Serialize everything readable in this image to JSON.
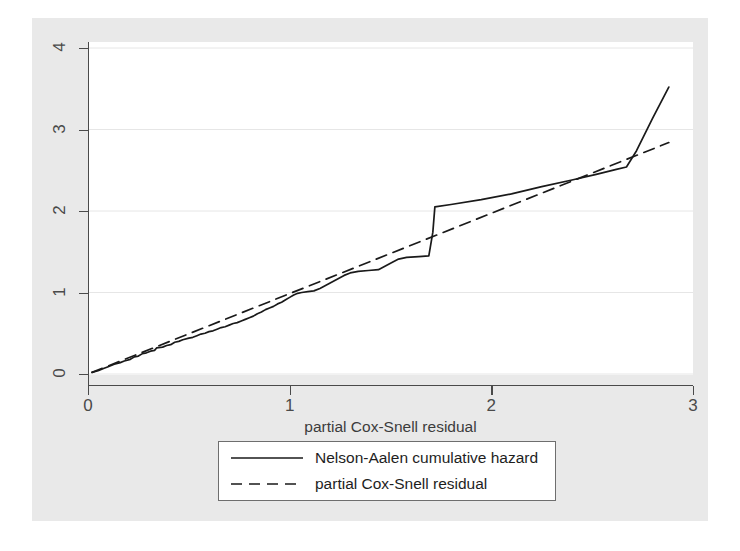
{
  "chart_data": {
    "type": "line",
    "title": "",
    "xlabel": "partial Cox-Snell residual",
    "ylabel": "",
    "xlim": [
      0,
      3
    ],
    "ylim": [
      0,
      4
    ],
    "xticks": [
      0,
      1,
      2,
      3
    ],
    "yticks": [
      0,
      1,
      2,
      3,
      4
    ],
    "xtick_labels": [
      "0",
      "1",
      "2",
      "3"
    ],
    "ytick_labels": [
      "0",
      "1",
      "2",
      "3",
      "4"
    ],
    "grid": "horizontal",
    "legend_position": "below-axis",
    "series": [
      {
        "name": "Nelson-Aalen cumulative hazard",
        "style": "solid",
        "color": "#1a1a1a",
        "points": [
          [
            0.02,
            0.02
          ],
          [
            0.05,
            0.04
          ],
          [
            0.08,
            0.07
          ],
          [
            0.1,
            0.09
          ],
          [
            0.13,
            0.12
          ],
          [
            0.16,
            0.14
          ],
          [
            0.18,
            0.16
          ],
          [
            0.21,
            0.18
          ],
          [
            0.23,
            0.21
          ],
          [
            0.25,
            0.22
          ],
          [
            0.27,
            0.25
          ],
          [
            0.29,
            0.26
          ],
          [
            0.31,
            0.28
          ],
          [
            0.33,
            0.29
          ],
          [
            0.34,
            0.32
          ],
          [
            0.37,
            0.33
          ],
          [
            0.39,
            0.35
          ],
          [
            0.41,
            0.36
          ],
          [
            0.43,
            0.39
          ],
          [
            0.45,
            0.4
          ],
          [
            0.47,
            0.42
          ],
          [
            0.5,
            0.44
          ],
          [
            0.52,
            0.45
          ],
          [
            0.54,
            0.47
          ],
          [
            0.56,
            0.49
          ],
          [
            0.58,
            0.5
          ],
          [
            0.6,
            0.52
          ],
          [
            0.62,
            0.53
          ],
          [
            0.64,
            0.55
          ],
          [
            0.66,
            0.57
          ],
          [
            0.68,
            0.58
          ],
          [
            0.7,
            0.6
          ],
          [
            0.72,
            0.62
          ],
          [
            0.74,
            0.63
          ],
          [
            0.76,
            0.65
          ],
          [
            0.78,
            0.67
          ],
          [
            0.8,
            0.69
          ],
          [
            0.82,
            0.71
          ],
          [
            0.84,
            0.74
          ],
          [
            0.86,
            0.76
          ],
          [
            0.88,
            0.79
          ],
          [
            0.9,
            0.81
          ],
          [
            0.92,
            0.83
          ],
          [
            0.94,
            0.86
          ],
          [
            0.96,
            0.88
          ],
          [
            0.98,
            0.91
          ],
          [
            1.0,
            0.94
          ],
          [
            1.02,
            0.97
          ],
          [
            1.04,
            0.99
          ],
          [
            1.06,
            1.0
          ],
          [
            1.09,
            1.01
          ],
          [
            1.12,
            1.02
          ],
          [
            1.15,
            1.05
          ],
          [
            1.18,
            1.09
          ],
          [
            1.21,
            1.13
          ],
          [
            1.24,
            1.17
          ],
          [
            1.27,
            1.21
          ],
          [
            1.3,
            1.24
          ],
          [
            1.34,
            1.26
          ],
          [
            1.39,
            1.27
          ],
          [
            1.44,
            1.28
          ],
          [
            1.5,
            1.36
          ],
          [
            1.54,
            1.41
          ],
          [
            1.58,
            1.43
          ],
          [
            1.64,
            1.44
          ],
          [
            1.69,
            1.45
          ],
          [
            1.71,
            1.74
          ],
          [
            1.72,
            2.05
          ],
          [
            1.8,
            2.08
          ],
          [
            1.95,
            2.14
          ],
          [
            2.1,
            2.21
          ],
          [
            2.25,
            2.3
          ],
          [
            2.4,
            2.38
          ],
          [
            2.52,
            2.45
          ],
          [
            2.62,
            2.51
          ],
          [
            2.67,
            2.54
          ],
          [
            2.72,
            2.74
          ],
          [
            2.8,
            3.14
          ],
          [
            2.88,
            3.52
          ]
        ]
      },
      {
        "name": "partial Cox-Snell residual",
        "style": "dashed",
        "color": "#1a1a1a",
        "points": [
          [
            0.02,
            0.02
          ],
          [
            2.88,
            2.84
          ]
        ]
      }
    ]
  },
  "axis": {
    "x_title": "partial Cox-Snell residual"
  },
  "legend": {
    "entries": [
      {
        "label": "Nelson-Aalen cumulative hazard",
        "style": "solid"
      },
      {
        "label": "partial Cox-Snell residual",
        "style": "dashed"
      }
    ]
  },
  "style": {
    "page_background": "#ffffff",
    "graph_region_background": "#e9e9e9",
    "plot_background": "#ffffff",
    "axis_color": "#4a4a4a",
    "gridline_color": "#e6e6e6",
    "line_color": "#1a1a1a",
    "legend_border_color": "#6e6e6e",
    "text_color": "#3c3c3c"
  }
}
